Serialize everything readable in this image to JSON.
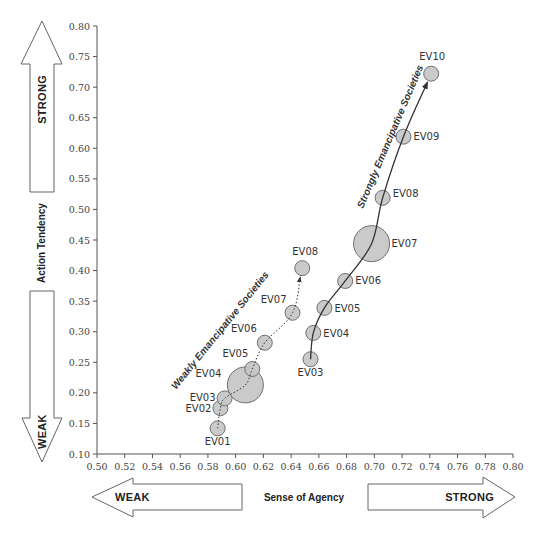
{
  "chart_data": {
    "type": "scatter",
    "title": "",
    "xlabel": "Sense of Agency",
    "ylabel": "Action Tendency",
    "xlim": [
      0.5,
      0.8
    ],
    "ylim": [
      0.1,
      0.8
    ],
    "grid": false,
    "legend": "none",
    "x_ticks": [
      "0.50",
      "0.52",
      "0.54",
      "0.56",
      "0.58",
      "0.60",
      "0.62",
      "0.64",
      "0.66",
      "0.68",
      "0.70",
      "0.72",
      "0.74",
      "0.76",
      "0.78",
      "0.80"
    ],
    "y_ticks": [
      "0.10",
      "0.15",
      "0.20",
      "0.25",
      "0.30",
      "0.35",
      "0.40",
      "0.45",
      "0.50",
      "0.55",
      "0.60",
      "0.65",
      "0.70",
      "0.75",
      "0.80"
    ],
    "annotations": {
      "y_arrow_up": "STRONG",
      "y_arrow_down": "WEAK",
      "x_arrow_left": "WEAK",
      "x_arrow_right": "STRONG"
    },
    "series": [
      {
        "name": "Weakly Emancipative Societies",
        "line_style": "dotted",
        "points": [
          {
            "label": "EV01",
            "x": 0.587,
            "y": 0.142,
            "size": "small"
          },
          {
            "label": "EV02",
            "x": 0.589,
            "y": 0.175,
            "size": "small"
          },
          {
            "label": "EV03",
            "x": 0.592,
            "y": 0.191,
            "size": "small"
          },
          {
            "label": "EV04",
            "x": 0.607,
            "y": 0.213,
            "size": "large"
          },
          {
            "label": "EV05",
            "x": 0.612,
            "y": 0.239,
            "size": "small"
          },
          {
            "label": "EV06",
            "x": 0.621,
            "y": 0.282,
            "size": "small"
          },
          {
            "label": "EV07",
            "x": 0.641,
            "y": 0.331,
            "size": "small"
          },
          {
            "label": "EV08",
            "x": 0.648,
            "y": 0.404,
            "size": "small"
          }
        ]
      },
      {
        "name": "Strongly Emancipative Societies",
        "line_style": "solid",
        "points": [
          {
            "label": "EV03",
            "x": 0.654,
            "y": 0.255,
            "size": "small"
          },
          {
            "label": "EV04",
            "x": 0.656,
            "y": 0.298,
            "size": "small"
          },
          {
            "label": "EV05",
            "x": 0.664,
            "y": 0.339,
            "size": "small"
          },
          {
            "label": "EV06",
            "x": 0.679,
            "y": 0.383,
            "size": "small"
          },
          {
            "label": "EV07",
            "x": 0.698,
            "y": 0.444,
            "size": "large"
          },
          {
            "label": "EV08",
            "x": 0.706,
            "y": 0.519,
            "size": "small"
          },
          {
            "label": "EV09",
            "x": 0.721,
            "y": 0.619,
            "size": "small"
          },
          {
            "label": "EV10",
            "x": 0.741,
            "y": 0.722,
            "size": "small"
          }
        ]
      }
    ]
  },
  "labels": {
    "ylabel": "Action Tendency",
    "xlabel": "Sense of Agency",
    "y_up": "STRONG",
    "y_down": "WEAK",
    "x_left": "WEAK",
    "x_right": "STRONG",
    "weak_series": "Weakly Emancipative Societies",
    "strong_series": "Strongly Emancipative Societies"
  },
  "colors": {
    "point_fill": "#c6c6c6",
    "point_stroke": "#6f6f6f",
    "axis": "#555555",
    "arrow_stroke": "#666666"
  }
}
